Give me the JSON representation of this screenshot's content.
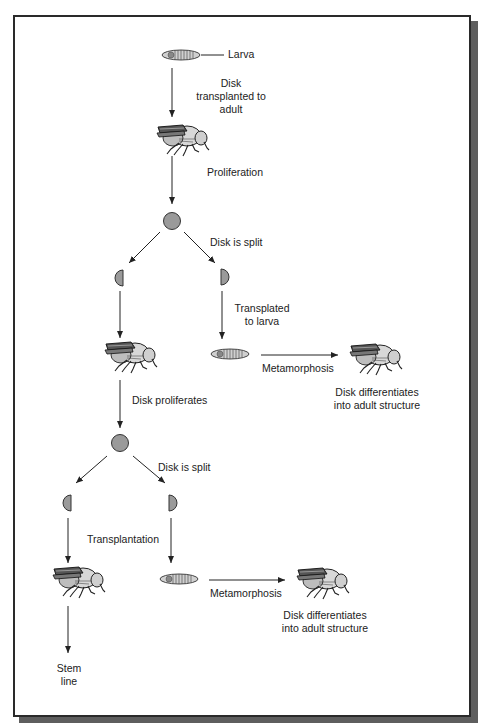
{
  "figure": {
    "type": "flow diagram"
  },
  "labels": {
    "larva": "Larva",
    "step1": [
      "Disk",
      "transplanted to",
      "adult"
    ],
    "proliferation": "Proliferation",
    "split1": "Disk is split",
    "transplanted_to_larva": [
      "Transplated",
      "to larva"
    ],
    "metamorphosis1": "Metamorphosis",
    "differentiates1": [
      "Disk differentiates",
      "into adult structure"
    ],
    "disk_proliferates": "Disk proliferates",
    "split2": "Disk is split",
    "transplantation": "Transplantation",
    "metamorphosis2": "Metamorphosis",
    "differentiates2": [
      "Disk differentiates",
      "into adult structure"
    ],
    "stem_line": [
      "Stem",
      "line"
    ]
  },
  "nodes": [
    {
      "id": "larva-1",
      "kind": "larva-icon"
    },
    {
      "id": "fly-1",
      "kind": "adult-fly-icon"
    },
    {
      "id": "disk-1",
      "kind": "disk-circle-icon"
    },
    {
      "id": "half-disk-1a",
      "kind": "half-disk-icon"
    },
    {
      "id": "half-disk-1b",
      "kind": "half-disk-icon"
    },
    {
      "id": "fly-2",
      "kind": "adult-fly-icon"
    },
    {
      "id": "larva-2",
      "kind": "larva-icon"
    },
    {
      "id": "fly-3",
      "kind": "adult-fly-icon"
    },
    {
      "id": "disk-2",
      "kind": "disk-circle-icon"
    },
    {
      "id": "half-disk-2a",
      "kind": "half-disk-icon"
    },
    {
      "id": "half-disk-2b",
      "kind": "half-disk-icon"
    },
    {
      "id": "fly-4",
      "kind": "adult-fly-icon"
    },
    {
      "id": "larva-3",
      "kind": "larva-icon"
    },
    {
      "id": "fly-5",
      "kind": "adult-fly-icon"
    }
  ],
  "colors": {
    "frame_border": "#2a2a2a",
    "shadow": "#5e5e5e",
    "disk_fill": "#9a9a9a",
    "line": "#222222"
  }
}
